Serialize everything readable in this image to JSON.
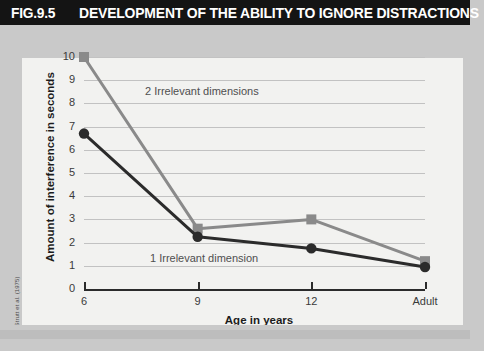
{
  "header": {
    "fig_number": "FIG.9.5",
    "title": "DEVELOPMENT OF THE ABILITY TO IGNORE DISTRACTIONS",
    "bar_color": "#141414",
    "text_color": "#ffffff"
  },
  "source_note": "Source: Strutt et al. (1975)",
  "chart_data": {
    "type": "line",
    "title": "DEVELOPMENT OF THE ABILITY TO IGNORE DISTRACTIONS",
    "xlabel": "Age in years",
    "ylabel": "Amount of interference in seconds",
    "categories": [
      "6",
      "9",
      "12",
      "Adult"
    ],
    "yticks": [
      0,
      1,
      2,
      3,
      4,
      5,
      6,
      7,
      8,
      9,
      10
    ],
    "ylim": [
      0,
      10
    ],
    "grid": true,
    "legend": "inline-annotations",
    "series": [
      {
        "name": "2 Irrelevant dimensions",
        "values": [
          10.0,
          2.6,
          3.0,
          1.2
        ],
        "color": "#8a8a8a",
        "marker": "square"
      },
      {
        "name": "1 Irrelevant dimension",
        "values": [
          6.7,
          2.25,
          1.75,
          0.95
        ],
        "color": "#2b2b2b",
        "marker": "circle"
      }
    ],
    "annotations": [
      {
        "text": "2 Irrelevant dimensions",
        "series": "2 Irrelevant dimensions"
      },
      {
        "text": "1 Irrelevant dimension",
        "series": "1 Irrelevant dimension"
      }
    ]
  }
}
